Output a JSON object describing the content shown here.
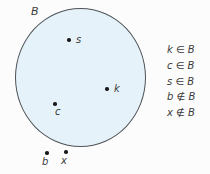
{
  "figure": {
    "set_label": "B",
    "inside_points": [
      {
        "label": "s"
      },
      {
        "label": "k"
      },
      {
        "label": "c"
      }
    ],
    "outside_points": [
      {
        "label": "b"
      },
      {
        "label": "x"
      }
    ]
  },
  "statements": [
    {
      "text": "k ∈ B"
    },
    {
      "text": "c ∈ B"
    },
    {
      "text": "s ∈ B"
    },
    {
      "text": "b ∉ B"
    },
    {
      "text": "x ∉ B"
    }
  ],
  "colors": {
    "circle_fill": "#e6f2f9",
    "circle_stroke": "#4e5357",
    "text": "#3a3a3a",
    "background": "#fcfcfc",
    "dot": "#1a1a1a"
  }
}
